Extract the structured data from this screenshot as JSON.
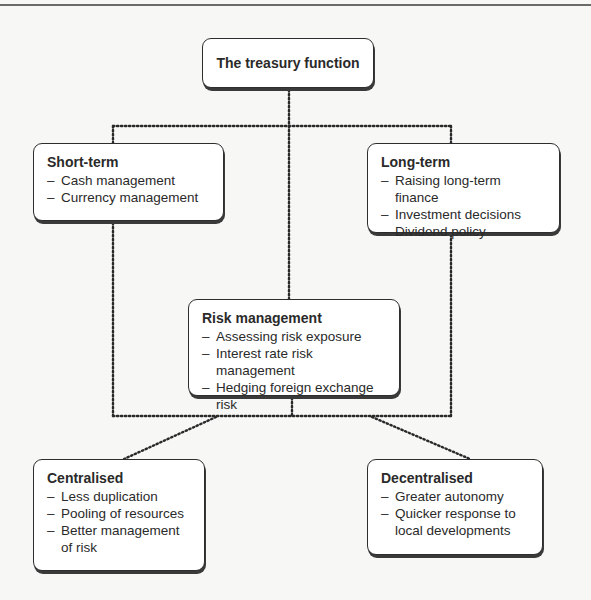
{
  "diagram": {
    "root": {
      "title": "The treasury function"
    },
    "short_term": {
      "title": "Short-term",
      "items": [
        "Cash management",
        "Currency management"
      ]
    },
    "long_term": {
      "title": "Long-term",
      "items": [
        "Raising long-term finance",
        "Investment decisions",
        "Dividend policy"
      ]
    },
    "risk": {
      "title": "Risk management",
      "items": [
        "Assessing risk exposure",
        "Interest rate risk management",
        "Hedging foreign exchange risk"
      ]
    },
    "centralised": {
      "title": "Centralised",
      "items": [
        "Less duplication",
        "Pooling of resources",
        "Better management of risk"
      ]
    },
    "decentralised": {
      "title": "Decentralised",
      "items": [
        "Greater autonomy",
        "Quicker response to local developments"
      ]
    },
    "style": {
      "line_color": "#2a2a2a",
      "box_border": "#2e2e2e",
      "background": "#f7f7f5"
    }
  }
}
